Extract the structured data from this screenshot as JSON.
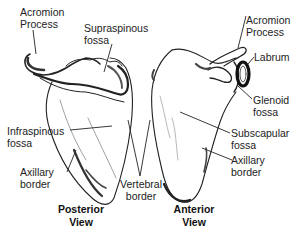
{
  "posterior": {
    "view_label": [
      "Posterior",
      "View"
    ],
    "labels": {
      "acromion": [
        "Acromion",
        "Process"
      ],
      "supraspinous": [
        "Supraspinous",
        "fossa"
      ],
      "infraspinous": [
        "Infraspinous",
        "fossa"
      ],
      "axillary": [
        "Axillary",
        "border"
      ]
    }
  },
  "shared": {
    "vertebral": [
      "Vertebral",
      "border"
    ]
  },
  "anterior": {
    "view_label": [
      "Anterior",
      "View"
    ],
    "labels": {
      "acromion": [
        "Acromion",
        "Process"
      ],
      "labrum": [
        "Labrum"
      ],
      "glenoid": [
        "Glenoid",
        "fossa"
      ],
      "subscapular": [
        "Subscapular",
        "fossa"
      ],
      "axillary": [
        "Axillary",
        "border"
      ]
    }
  }
}
